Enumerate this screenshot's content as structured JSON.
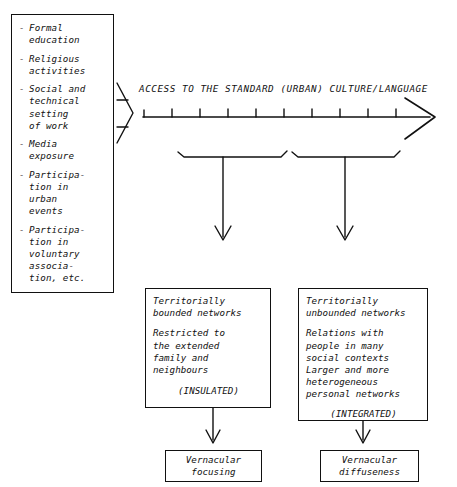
{
  "diagram": {
    "inputs_box": {
      "bullet": "-",
      "items": [
        "Formal\neducation",
        "Religious\nactivities",
        "Social and\ntechnical\nsetting\nof work",
        "Media\nexposure",
        "Participa-\ntion in\nurban\nevents",
        "Participa-\ntion in\nvoluntary\nassocia-\ntion, etc."
      ]
    },
    "axis": {
      "title": "ACCESS TO THE  STANDARD (URBAN) CULTURE/LANGUAGE",
      "tick_count": 10,
      "arrow_direction": "right"
    },
    "funnel_arrow": {
      "name": "chevron-arrow",
      "direction": "right"
    },
    "brackets": [
      {
        "label": "low-access-bracket"
      },
      {
        "label": "high-access-bracket"
      }
    ],
    "mid_boxes": [
      {
        "heading": "Territorially\nbounded networks",
        "body": "Restricted to\nthe extended\nfamily and\nneighbours",
        "tag": "(INSULATED)"
      },
      {
        "heading": "Territorially\nunbounded networks",
        "body": "Relations with\npeople in many\nsocial contexts\nLarger and more\nheterogeneous\npersonal networks",
        "tag": "(INTEGRATED)"
      }
    ],
    "end_boxes": [
      {
        "label": "Vernacular\nfocusing"
      },
      {
        "label": "Vernacular\ndiffuseness"
      }
    ],
    "colors": {
      "ink": "#111111",
      "paper": "#ffffff"
    }
  }
}
